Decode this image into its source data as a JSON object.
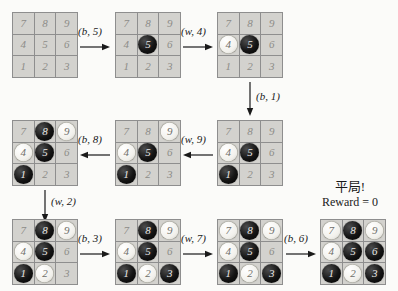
{
  "diagram": {
    "cell_numbers": [
      [
        7,
        8,
        9
      ],
      [
        4,
        5,
        6
      ],
      [
        1,
        2,
        3
      ]
    ],
    "colors": {
      "black_stone": "#141414",
      "white_stone": "#f2f1ec",
      "cell_bg": "#d3d2ce",
      "grid_line": "#8e8e8e",
      "page_bg": "#fbfbf9"
    },
    "boards": [
      {
        "id": "board-1",
        "name": "empty-board",
        "cells": [
          {
            "n": 7,
            "state": "empty"
          },
          {
            "n": 8,
            "state": "empty"
          },
          {
            "n": 9,
            "state": "empty"
          },
          {
            "n": 4,
            "state": "empty"
          },
          {
            "n": 5,
            "state": "empty"
          },
          {
            "n": 6,
            "state": "empty"
          },
          {
            "n": 1,
            "state": "empty"
          },
          {
            "n": 2,
            "state": "empty"
          },
          {
            "n": 3,
            "state": "empty"
          }
        ]
      },
      {
        "id": "board-2",
        "name": "board-after-b5",
        "cells": [
          {
            "n": 7,
            "state": "empty"
          },
          {
            "n": 8,
            "state": "empty"
          },
          {
            "n": 9,
            "state": "empty"
          },
          {
            "n": 4,
            "state": "empty"
          },
          {
            "n": 5,
            "state": "black"
          },
          {
            "n": 6,
            "state": "empty"
          },
          {
            "n": 1,
            "state": "empty"
          },
          {
            "n": 2,
            "state": "empty"
          },
          {
            "n": 3,
            "state": "empty"
          }
        ]
      },
      {
        "id": "board-3",
        "name": "board-after-w4",
        "cells": [
          {
            "n": 7,
            "state": "empty"
          },
          {
            "n": 8,
            "state": "empty"
          },
          {
            "n": 9,
            "state": "empty"
          },
          {
            "n": 4,
            "state": "white"
          },
          {
            "n": 5,
            "state": "black"
          },
          {
            "n": 6,
            "state": "empty"
          },
          {
            "n": 1,
            "state": "empty"
          },
          {
            "n": 2,
            "state": "empty"
          },
          {
            "n": 3,
            "state": "empty"
          }
        ]
      },
      {
        "id": "board-4",
        "name": "board-after-b1",
        "cells": [
          {
            "n": 7,
            "state": "empty"
          },
          {
            "n": 8,
            "state": "empty"
          },
          {
            "n": 9,
            "state": "empty"
          },
          {
            "n": 4,
            "state": "white"
          },
          {
            "n": 5,
            "state": "black"
          },
          {
            "n": 6,
            "state": "empty"
          },
          {
            "n": 1,
            "state": "black"
          },
          {
            "n": 2,
            "state": "empty"
          },
          {
            "n": 3,
            "state": "empty"
          }
        ]
      },
      {
        "id": "board-5",
        "name": "board-after-w9",
        "cells": [
          {
            "n": 7,
            "state": "empty"
          },
          {
            "n": 8,
            "state": "empty"
          },
          {
            "n": 9,
            "state": "white"
          },
          {
            "n": 4,
            "state": "white"
          },
          {
            "n": 5,
            "state": "black"
          },
          {
            "n": 6,
            "state": "empty"
          },
          {
            "n": 1,
            "state": "black"
          },
          {
            "n": 2,
            "state": "empty"
          },
          {
            "n": 3,
            "state": "empty"
          }
        ]
      },
      {
        "id": "board-6",
        "name": "board-after-b8",
        "cells": [
          {
            "n": 7,
            "state": "empty"
          },
          {
            "n": 8,
            "state": "black"
          },
          {
            "n": 9,
            "state": "white"
          },
          {
            "n": 4,
            "state": "white"
          },
          {
            "n": 5,
            "state": "black"
          },
          {
            "n": 6,
            "state": "empty"
          },
          {
            "n": 1,
            "state": "black"
          },
          {
            "n": 2,
            "state": "empty"
          },
          {
            "n": 3,
            "state": "empty"
          }
        ]
      },
      {
        "id": "board-7",
        "name": "board-after-w2",
        "cells": [
          {
            "n": 7,
            "state": "empty"
          },
          {
            "n": 8,
            "state": "black"
          },
          {
            "n": 9,
            "state": "white"
          },
          {
            "n": 4,
            "state": "white"
          },
          {
            "n": 5,
            "state": "black"
          },
          {
            "n": 6,
            "state": "empty"
          },
          {
            "n": 1,
            "state": "black"
          },
          {
            "n": 2,
            "state": "white"
          },
          {
            "n": 3,
            "state": "empty"
          }
        ]
      },
      {
        "id": "board-8",
        "name": "board-after-b3",
        "cells": [
          {
            "n": 7,
            "state": "empty"
          },
          {
            "n": 8,
            "state": "black"
          },
          {
            "n": 9,
            "state": "white"
          },
          {
            "n": 4,
            "state": "white"
          },
          {
            "n": 5,
            "state": "black"
          },
          {
            "n": 6,
            "state": "empty"
          },
          {
            "n": 1,
            "state": "black"
          },
          {
            "n": 2,
            "state": "white"
          },
          {
            "n": 3,
            "state": "black"
          }
        ]
      },
      {
        "id": "board-9",
        "name": "board-after-w7",
        "cells": [
          {
            "n": 7,
            "state": "white"
          },
          {
            "n": 8,
            "state": "black"
          },
          {
            "n": 9,
            "state": "white"
          },
          {
            "n": 4,
            "state": "white"
          },
          {
            "n": 5,
            "state": "black"
          },
          {
            "n": 6,
            "state": "empty"
          },
          {
            "n": 1,
            "state": "black"
          },
          {
            "n": 2,
            "state": "white"
          },
          {
            "n": 3,
            "state": "black"
          }
        ]
      },
      {
        "id": "board-10",
        "name": "board-after-b6-final",
        "cells": [
          {
            "n": 7,
            "state": "white"
          },
          {
            "n": 8,
            "state": "black"
          },
          {
            "n": 9,
            "state": "white"
          },
          {
            "n": 4,
            "state": "white"
          },
          {
            "n": 5,
            "state": "black"
          },
          {
            "n": 6,
            "state": "black"
          },
          {
            "n": 1,
            "state": "black"
          },
          {
            "n": 2,
            "state": "white"
          },
          {
            "n": 3,
            "state": "black"
          }
        ]
      }
    ],
    "transitions": [
      {
        "id": "t1",
        "label": "(b, 5)",
        "direction": "right"
      },
      {
        "id": "t2",
        "label": "(w, 4)",
        "direction": "right"
      },
      {
        "id": "t3",
        "label": "(b, 1)",
        "direction": "down"
      },
      {
        "id": "t4",
        "label": "(w, 9)",
        "direction": "left"
      },
      {
        "id": "t5",
        "label": "(b, 8)",
        "direction": "left"
      },
      {
        "id": "t6",
        "label": "(w, 2)",
        "direction": "down"
      },
      {
        "id": "t7",
        "label": "(b, 3)",
        "direction": "right"
      },
      {
        "id": "t8",
        "label": "(w, 7)",
        "direction": "right"
      },
      {
        "id": "t9",
        "label": "(b, 6)",
        "direction": "right"
      }
    ],
    "result": {
      "outcome_cn": "平局!",
      "reward_text": "Reward = 0"
    }
  }
}
